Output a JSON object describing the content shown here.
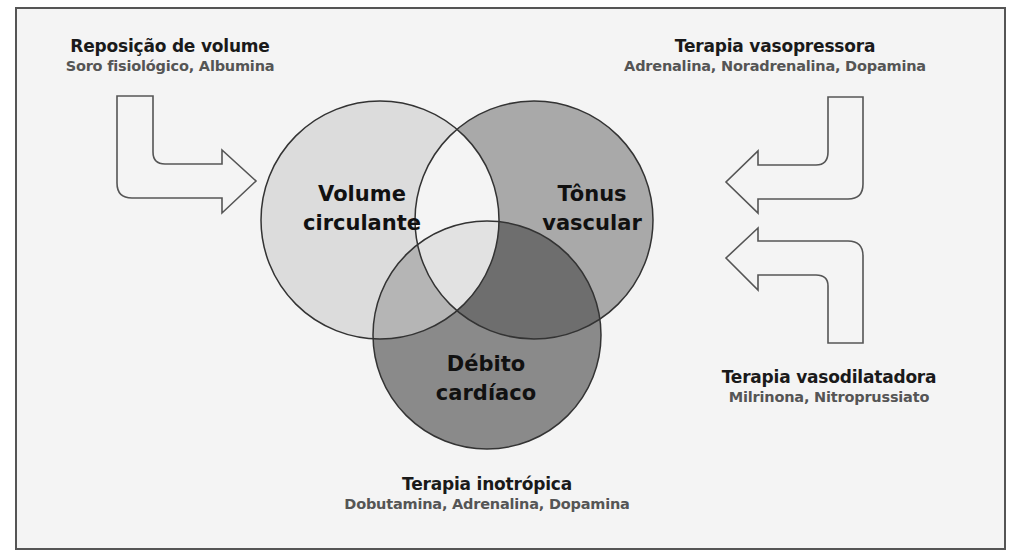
{
  "diagram": {
    "type": "venn",
    "circles": [
      {
        "id": "volume",
        "line1": "Volume",
        "line2": "circulante",
        "color": "#dcdcdc"
      },
      {
        "id": "tonus",
        "line1": "Tônus",
        "line2": "vascular",
        "color": "#a9a9a9"
      },
      {
        "id": "debito",
        "line1": "Débito",
        "line2": "cardíaco",
        "color": "#8a8a8a"
      }
    ],
    "intersection_colors": {
      "volume_tonus": "#f4f4f4",
      "volume_debito": "#b5b5b5",
      "tonus_debito": "#6e6e6e",
      "center": "#e2e2e2"
    },
    "therapies": {
      "volume": {
        "title": "Reposição de volume",
        "drugs": "Soro fisiológico, Albumina"
      },
      "vasopressor": {
        "title": "Terapia vasopressora",
        "drugs": "Adrenalina, Noradrenalina, Dopamina"
      },
      "vasodilator": {
        "title": "Terapia vasodilatadora",
        "drugs": "Milrinona, Nitroprussiato"
      },
      "inotropic": {
        "title": "Terapia inotrópica",
        "drugs": "Dobutamina, Adrenalina, Dopamina"
      }
    }
  }
}
